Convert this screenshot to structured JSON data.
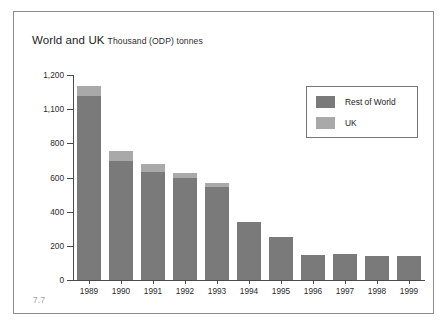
{
  "figure": {
    "number_label": "7.7",
    "title_main": "World and UK",
    "title_sub": "Thousand (ODP) tonnes"
  },
  "legend": {
    "position": "top-right",
    "entries": [
      {
        "label": "Rest of World",
        "color": "#7a7a7a"
      },
      {
        "label": "UK",
        "color": "#a9a9a9"
      }
    ]
  },
  "axis": {
    "y_tick_labels": [
      "1,200",
      "1,100",
      "800",
      "600",
      "400",
      "200",
      "0"
    ],
    "y_tick_values": [
      1200,
      1000,
      800,
      600,
      400,
      200,
      0
    ],
    "x_tick_labels": [
      "1989",
      "1990",
      "1991",
      "1992",
      "1993",
      "1994",
      "1995",
      "1996",
      "1997",
      "1998",
      "1999"
    ]
  },
  "chart_data": {
    "type": "bar",
    "stacked": true,
    "xlabel": "",
    "ylabel": "Thousand (ODP) tonnes",
    "ylim": [
      0,
      1200
    ],
    "grid": false,
    "legend_position": "top-right",
    "categories": [
      "1989",
      "1990",
      "1991",
      "1992",
      "1993",
      "1994",
      "1995",
      "1996",
      "1997",
      "1998",
      "1999"
    ],
    "series": [
      {
        "name": "Rest of World",
        "color": "#7a7a7a",
        "values": [
          1075,
          695,
          630,
          595,
          545,
          340,
          250,
          145,
          155,
          140,
          140
        ]
      },
      {
        "name": "UK",
        "color": "#a9a9a9",
        "values": [
          60,
          60,
          50,
          30,
          25,
          0,
          0,
          0,
          0,
          0,
          0
        ]
      }
    ],
    "totals": [
      1135,
      755,
      680,
      625,
      570,
      340,
      250,
      145,
      155,
      140,
      140
    ]
  }
}
